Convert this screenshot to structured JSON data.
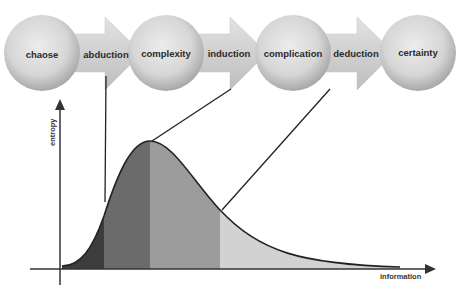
{
  "diagram": {
    "stages": [
      {
        "label": "chaose",
        "cx": 42
      },
      {
        "label": "complexity",
        "cx": 166
      },
      {
        "label": "complication",
        "cx": 293
      },
      {
        "label": "certainty",
        "cx": 418
      }
    ],
    "transitions": [
      {
        "label": "abduction",
        "x": 104
      },
      {
        "label": "induction",
        "x": 229
      },
      {
        "label": "deduction",
        "x": 356
      }
    ],
    "axes": {
      "y_label": "entropy",
      "x_label": "information"
    },
    "colors": {
      "sphere_light": "#e6e6e6",
      "sphere_dark": "#9a9a9a",
      "arrow_fill": "#d4d4d4",
      "region_1": "#3d3d3d",
      "region_2": "#6b6b6b",
      "region_3": "#9c9c9c",
      "region_4": "#d2d2d2",
      "line": "#222222"
    }
  }
}
